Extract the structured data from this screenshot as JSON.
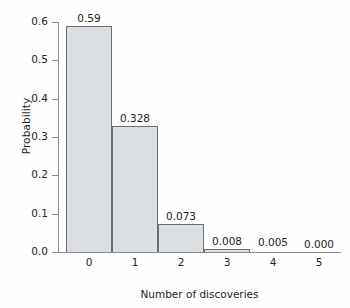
{
  "chart_data": {
    "type": "bar",
    "title": "",
    "subtitle": "",
    "xlabel": "Number of discoveries",
    "ylabel": "Probability",
    "categories": [
      "0",
      "1",
      "2",
      "3",
      "4",
      "5"
    ],
    "values": [
      0.59,
      0.328,
      0.073,
      0.008,
      0.005,
      0.0
    ],
    "value_labels": [
      "0.59",
      "0.328",
      "0.073",
      "0.008",
      "0.005",
      "0.000"
    ],
    "ylim": [
      0.0,
      0.6
    ],
    "ytick_values": [
      0.0,
      0.1,
      0.2,
      0.3,
      0.4,
      0.5,
      0.6
    ],
    "ytick_labels": [
      "0.0",
      "0.1",
      "0.2",
      "0.3",
      "0.4",
      "0.5",
      "0.6"
    ],
    "xtick_labels": [
      "0",
      "1",
      "2",
      "3",
      "4",
      "5"
    ],
    "grid": false,
    "legend": null,
    "legend_position": "none",
    "bar_fill_color": "#dcdfe1",
    "bar_edge_color": "#6d6e71",
    "axis_color": "#8d8d8d",
    "text_color": "#231f20",
    "background_color": "#fefefe"
  }
}
